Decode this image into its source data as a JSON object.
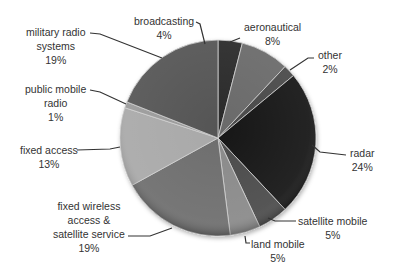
{
  "chart_data": {
    "type": "pie",
    "title": "",
    "legend": "none",
    "center": [
      218,
      138
    ],
    "radius": 98,
    "start_angle_deg": -90,
    "slices": [
      {
        "label": "broadcasting",
        "value": 4,
        "pct_label": "4%",
        "color": "#2c2c2c"
      },
      {
        "label": "aeronautical",
        "value": 8,
        "pct_label": "8%",
        "color": "#6a6a6a"
      },
      {
        "label": "other",
        "value": 2,
        "pct_label": "2%",
        "color": "#4a4a4a"
      },
      {
        "label": "radar",
        "value": 24,
        "pct_label": "24%",
        "color": "#141414"
      },
      {
        "label": "satellite mobile",
        "value": 5,
        "pct_label": "5%",
        "color": "#4c4c4c"
      },
      {
        "label": "land mobile",
        "value": 5,
        "pct_label": "5%",
        "color": "#8a8a8a"
      },
      {
        "label": "fixed wireless access & satellite service",
        "value": 19,
        "pct_label": "19%",
        "color": "#6e6e6e"
      },
      {
        "label": "fixed access",
        "value": 13,
        "pct_label": "13%",
        "color": "#a9a9a9"
      },
      {
        "label": "public mobile radio",
        "value": 1,
        "pct_label": "1%",
        "color": "#9a9a9a"
      },
      {
        "label": "military radio systems",
        "value": 19,
        "pct_label": "19%",
        "color": "#555555"
      }
    ]
  },
  "labels": {
    "broadcasting": {
      "lines": [
        "broadcasting",
        "4%"
      ]
    },
    "aeronautical": {
      "lines": [
        "aeronautical",
        "8%"
      ]
    },
    "other": {
      "lines": [
        "other",
        "2%"
      ]
    },
    "radar": {
      "lines": [
        "radar",
        "24%"
      ]
    },
    "satellite_mobile": {
      "lines": [
        "satellite mobile",
        "5%"
      ]
    },
    "land_mobile": {
      "lines": [
        "land mobile",
        "5%"
      ]
    },
    "fixed_wireless": {
      "lines": [
        "fixed wireless",
        "access &",
        "satellite service",
        "19%"
      ]
    },
    "fixed_access": {
      "lines": [
        "fixed access",
        "13%"
      ]
    },
    "public_mobile": {
      "lines": [
        "public mobile",
        "radio",
        "1%"
      ]
    },
    "military": {
      "lines": [
        "military radio",
        "systems",
        "19%"
      ]
    }
  }
}
